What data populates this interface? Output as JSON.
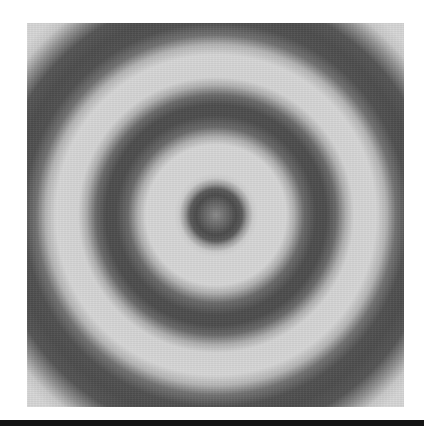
{
  "image": {
    "subject": "concentric circular interference rings",
    "style": "grayscale",
    "colors": {
      "background": "#ffffff",
      "light_band": "#d6d6d6",
      "dark_band": "#4c4c4c",
      "center_spot": "#8a8a8a",
      "bottom_bar": "#141414"
    },
    "rings": [
      {
        "name": "center-spot",
        "outer_radius_px": 30
      },
      {
        "name": "middle-ring",
        "inner_radius_px": 80,
        "outer_radius_px": 128
      },
      {
        "name": "outer-ring",
        "inner_radius_px": 172,
        "outer_radius_px": 240
      }
    ]
  }
}
